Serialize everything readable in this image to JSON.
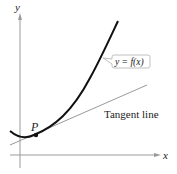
{
  "diagram": {
    "axes": {
      "x_label": "x",
      "y_label": "y"
    },
    "curve_label": "y = f(x)",
    "point_label": "P",
    "tangent_label": "Tangent line",
    "colors": {
      "curve": "#111111",
      "tangent": "#9a9a9a",
      "axes": "#9a9a9a",
      "label_box": "#b0b0b0"
    }
  }
}
